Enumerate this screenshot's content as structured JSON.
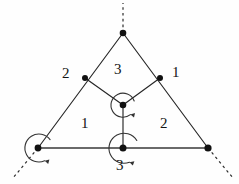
{
  "figure": {
    "kind": "orbifold-triangle-diagram",
    "background_color": "#fefefe",
    "stroke_color": "#262626",
    "width": 239,
    "height": 184
  },
  "labels": {
    "left_upper": "2",
    "top_center": "3",
    "right_upper": "1",
    "lower_left": "1",
    "lower_right": "2",
    "bottom_center": "3"
  },
  "vertices": [
    {
      "name": "apex",
      "x": 123,
      "y": 33,
      "radius": 3.2,
      "rotation_marker": false
    },
    {
      "name": "left-mid",
      "x": 85,
      "y": 78,
      "radius": 3.0,
      "rotation_marker": false
    },
    {
      "name": "right-mid",
      "x": 160,
      "y": 78,
      "radius": 3.0,
      "rotation_marker": false
    },
    {
      "name": "center",
      "x": 123,
      "y": 105,
      "radius": 3.2,
      "rotation_marker": true
    },
    {
      "name": "bottom-left",
      "x": 38,
      "y": 148,
      "radius": 3.2,
      "rotation_marker": true
    },
    {
      "name": "bottom-center",
      "x": 123,
      "y": 148,
      "radius": 3.4,
      "rotation_marker": true
    },
    {
      "name": "bottom-right",
      "x": 208,
      "y": 148,
      "radius": 3.4,
      "rotation_marker": false
    }
  ],
  "edges": [
    {
      "name": "apex-to-bottom-left",
      "from": "apex",
      "to": "bottom-left"
    },
    {
      "name": "apex-to-bottom-right",
      "from": "apex",
      "to": "bottom-right"
    },
    {
      "name": "left-mid-to-center",
      "from": "left-mid",
      "to": "center"
    },
    {
      "name": "right-mid-to-center",
      "from": "right-mid",
      "to": "center"
    },
    {
      "name": "center-to-bottom-center",
      "from": "center",
      "to": "bottom-center"
    },
    {
      "name": "baseline",
      "from": "bottom-left",
      "to": "bottom-right"
    }
  ],
  "dashed_rays": [
    {
      "name": "apex-ray-up",
      "x1": 123,
      "y1": 33,
      "x2": 123,
      "y2": 3
    },
    {
      "name": "bottom-left-ray",
      "x1": 38,
      "y1": 148,
      "x2": 14,
      "y2": 177
    },
    {
      "name": "bottom-right-ray",
      "x1": 208,
      "y1": 148,
      "x2": 232,
      "y2": 177
    }
  ],
  "rotation_markers": [
    {
      "name": "center-rotation",
      "cx": 123,
      "cy": 105,
      "r": 12
    },
    {
      "name": "bottom-center-rotation",
      "cx": 123,
      "cy": 148,
      "r": 15
    },
    {
      "name": "bottom-left-rotation",
      "cx": 38,
      "cy": 148,
      "r": 14
    }
  ]
}
